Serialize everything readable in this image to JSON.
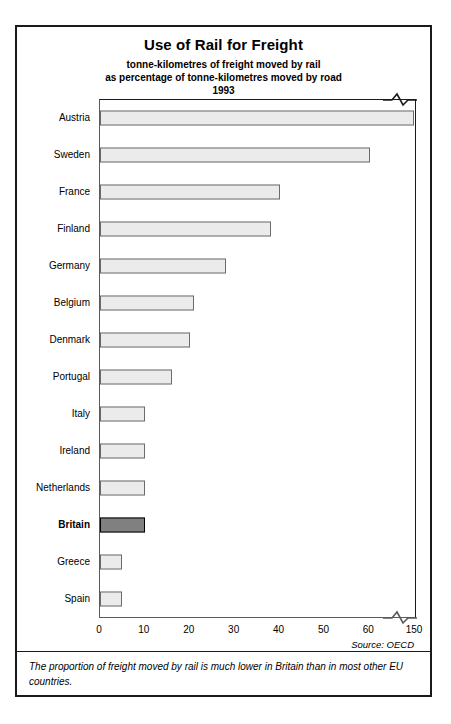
{
  "chart": {
    "title": "Use of Rail for Freight",
    "subtitle_line1": "tonne-kilometres of freight moved by rail",
    "subtitle_line2": "as percentage of tonne-kilometres moved by road",
    "year": "1993",
    "source": "Source: OECD",
    "footnote": "The proportion of freight moved by rail is much lower in Britain than in most other EU countries.",
    "highlight_country": "Britain",
    "bar_fill": "#ebebeb",
    "bar_highlight_fill": "#808080",
    "bar_border": "#6b6b6b"
  },
  "chart_data": {
    "type": "bar",
    "orientation": "horizontal",
    "title": "Use of Rail for Freight",
    "subtitle": "tonne-kilometres of freight moved by rail as percentage of tonne-kilometres moved by road",
    "year": "1993",
    "xlabel": "",
    "ylabel": "",
    "grid": false,
    "legend": "none",
    "axis_break": true,
    "axis_break_between": [
      60,
      150
    ],
    "xticks": [
      0,
      10,
      20,
      30,
      40,
      50,
      60,
      150
    ],
    "xlim": [
      0,
      150
    ],
    "categories": [
      "Austria",
      "Sweden",
      "France",
      "Finland",
      "Germany",
      "Belgium",
      "Denmark",
      "Portugal",
      "Italy",
      "Ireland",
      "Netherlands",
      "Britain",
      "Greece",
      "Spain"
    ],
    "values": [
      148,
      62,
      40,
      38,
      28,
      21,
      20,
      16,
      10,
      10,
      10,
      10,
      5,
      5
    ],
    "highlight": "Britain",
    "source": "Source: OECD",
    "annotation": "The proportion of freight moved by rail is much lower in Britain than in most other EU countries."
  }
}
